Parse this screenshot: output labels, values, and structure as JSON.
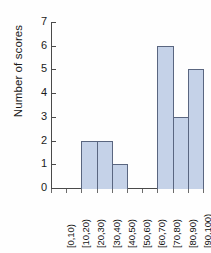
{
  "chart_data": {
    "type": "bar",
    "title": "",
    "subtitle": "",
    "xlabel": "",
    "ylabel": "Number of scores",
    "categories": [
      "[0,10)",
      "[10,20)",
      "[20,30)",
      "[30,40)",
      "[40,50)",
      "[50,60)",
      "[60,70)",
      "[70,80)",
      "[80,90)",
      "[90,100)"
    ],
    "values": [
      0,
      0,
      2,
      2,
      1,
      0,
      0,
      6,
      3,
      5
    ],
    "ylim": [
      0,
      7
    ],
    "ytick_labels": [
      "0",
      "1",
      "2",
      "3",
      "4",
      "5",
      "6",
      "7"
    ],
    "ytick_values": [
      0,
      1,
      2,
      3,
      4,
      5,
      6,
      7
    ],
    "grid": false,
    "legend": null,
    "bar_fill_color": "#c5d2e8",
    "bar_edge_color": "#5a6680",
    "axis_color": "#4a4a4a",
    "background_color": "#fefefe",
    "annotations": []
  }
}
